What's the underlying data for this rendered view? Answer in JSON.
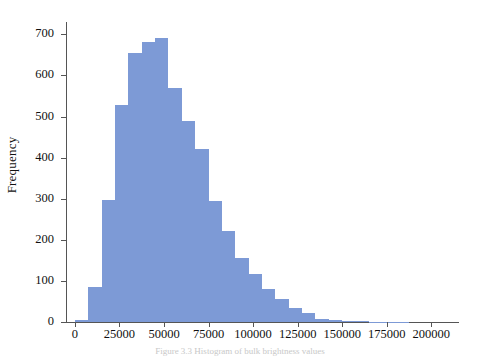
{
  "figure": {
    "background_color": "#ffffff",
    "bar_color": "#7d9ad6",
    "axis_color": "#555555",
    "caption": "Figure 3.3 Histogram of bulk brightness values"
  },
  "chart_data": {
    "type": "bar",
    "title": "",
    "xlabel": "",
    "ylabel": "Frequency",
    "xlim": [
      -5000,
      215000
    ],
    "ylim": [
      0,
      730
    ],
    "grid": false,
    "legend": null,
    "bin_width": 7500,
    "x_tick_labels": [
      "0",
      "25000",
      "50000",
      "75000",
      "100000",
      "125000",
      "150000",
      "175000",
      "200000"
    ],
    "x_ticks": [
      0,
      25000,
      50000,
      75000,
      100000,
      125000,
      150000,
      175000,
      200000
    ],
    "y_tick_labels": [
      "0",
      "100",
      "200",
      "300",
      "400",
      "500",
      "600",
      "700"
    ],
    "y_ticks": [
      0,
      100,
      200,
      300,
      400,
      500,
      600,
      700
    ],
    "bins": [
      {
        "start": 0,
        "end": 7500,
        "value": 5
      },
      {
        "start": 7500,
        "end": 15000,
        "value": 85
      },
      {
        "start": 15000,
        "end": 22500,
        "value": 297
      },
      {
        "start": 22500,
        "end": 30000,
        "value": 527
      },
      {
        "start": 30000,
        "end": 37500,
        "value": 655
      },
      {
        "start": 37500,
        "end": 45000,
        "value": 682
      },
      {
        "start": 45000,
        "end": 52500,
        "value": 691
      },
      {
        "start": 52500,
        "end": 60000,
        "value": 569
      },
      {
        "start": 60000,
        "end": 67500,
        "value": 489
      },
      {
        "start": 67500,
        "end": 75000,
        "value": 420
      },
      {
        "start": 75000,
        "end": 82500,
        "value": 295
      },
      {
        "start": 82500,
        "end": 90000,
        "value": 222
      },
      {
        "start": 90000,
        "end": 97500,
        "value": 155
      },
      {
        "start": 97500,
        "end": 105000,
        "value": 117
      },
      {
        "start": 105000,
        "end": 112500,
        "value": 80
      },
      {
        "start": 112500,
        "end": 120000,
        "value": 57
      },
      {
        "start": 120000,
        "end": 127500,
        "value": 34
      },
      {
        "start": 127500,
        "end": 135000,
        "value": 21
      },
      {
        "start": 135000,
        "end": 142500,
        "value": 8
      },
      {
        "start": 142500,
        "end": 150000,
        "value": 6
      },
      {
        "start": 150000,
        "end": 157500,
        "value": 3
      },
      {
        "start": 157500,
        "end": 165000,
        "value": 2
      },
      {
        "start": 165000,
        "end": 172500,
        "value": 1
      },
      {
        "start": 172500,
        "end": 180000,
        "value": 1
      },
      {
        "start": 180000,
        "end": 187500,
        "value": 1
      }
    ]
  }
}
